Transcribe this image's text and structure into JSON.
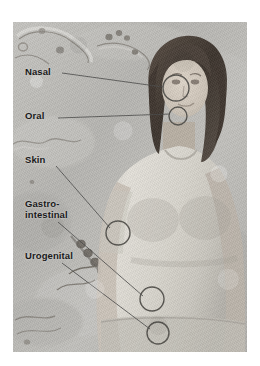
{
  "figure": {
    "kind": "anatomical-illustration",
    "background_color": "#ffffff",
    "panel_color": "#b9b9b7"
  },
  "labels": [
    {
      "id": "nasal",
      "text": "Nasal"
    },
    {
      "id": "oral",
      "text": "Oral"
    },
    {
      "id": "skin",
      "text": "Skin"
    },
    {
      "id": "gastrointestinal",
      "text": "Gastro-\nintestinal"
    },
    {
      "id": "urogenital",
      "text": "Urogenital"
    }
  ],
  "callout_circles": [
    {
      "id": "nasal-site",
      "cx": 176,
      "cy": 88,
      "r": 13
    },
    {
      "id": "oral-site",
      "cx": 178,
      "cy": 116,
      "r": 9
    },
    {
      "id": "skin-site",
      "cx": 118,
      "cy": 233,
      "r": 12
    },
    {
      "id": "gastrointestinal-site",
      "cx": 152,
      "cy": 299,
      "r": 12
    },
    {
      "id": "urogenital-site",
      "cx": 158,
      "cy": 333,
      "r": 11
    }
  ],
  "leader_lines": [
    {
      "id": "nasal-leader",
      "x1": 62,
      "y1": 73,
      "x2": 165,
      "y2": 87
    },
    {
      "id": "oral-leader",
      "x1": 58,
      "y1": 118,
      "x2": 170,
      "y2": 114
    },
    {
      "id": "skin-leader",
      "x1": 56,
      "y1": 166,
      "x2": 110,
      "y2": 228
    },
    {
      "id": "gastrointestinal-leader",
      "x1": 58,
      "y1": 222,
      "x2": 143,
      "y2": 296
    },
    {
      "id": "urogenital-leader",
      "x1": 62,
      "y1": 263,
      "x2": 150,
      "y2": 329
    }
  ],
  "colors": {
    "ink": "#1a1a1a",
    "leader_line": "#4a4a48",
    "circle_stroke": "#56544f",
    "skin_tone": "#cfc8bf",
    "hair": "#433a33",
    "shirt": "#dedbd4",
    "microbe": "#6b665f"
  },
  "background_microbes": [
    {
      "id": "microbe-cluster-top-left",
      "type": "bacilli-and-cocci"
    },
    {
      "id": "microbe-cluster-top-mid",
      "type": "cocci-cluster"
    },
    {
      "id": "microbe-chain-bottom-left",
      "type": "streptococcus-chain"
    },
    {
      "id": "microbe-filament-mid-left",
      "type": "spirilla-filament"
    },
    {
      "id": "microbe-spore-bottom",
      "type": "rod-cluster"
    }
  ]
}
